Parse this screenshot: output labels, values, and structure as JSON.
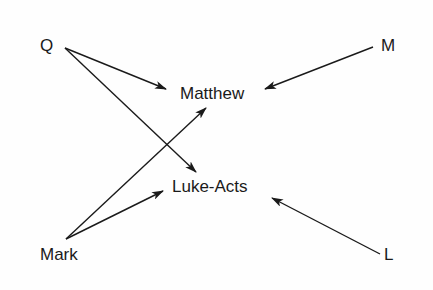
{
  "diagram": {
    "type": "source-dependency-graph",
    "nodes": {
      "q": {
        "label": "Q"
      },
      "m": {
        "label": "M"
      },
      "mark": {
        "label": "Mark"
      },
      "l": {
        "label": "L"
      },
      "matthew": {
        "label": "Matthew"
      },
      "lukeacts": {
        "label": "Luke-Acts"
      }
    },
    "edges": [
      {
        "from": "Q",
        "to": "Matthew"
      },
      {
        "from": "Q",
        "to": "Luke-Acts"
      },
      {
        "from": "M",
        "to": "Matthew"
      },
      {
        "from": "Mark",
        "to": "Matthew"
      },
      {
        "from": "Mark",
        "to": "Luke-Acts"
      },
      {
        "from": "L",
        "to": "Luke-Acts"
      }
    ],
    "colors": {
      "line": "#1a1a1a",
      "text": "#1a1a1a",
      "background": "#ffffff"
    }
  }
}
